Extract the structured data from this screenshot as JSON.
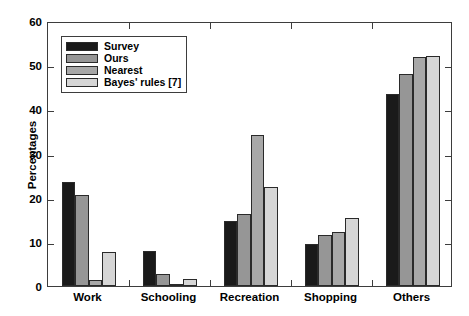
{
  "chart_data": {
    "type": "bar",
    "title": "",
    "xlabel": "",
    "ylabel": "Percentages",
    "ylim": [
      0,
      60
    ],
    "yticks": [
      0,
      10,
      20,
      30,
      40,
      50,
      60
    ],
    "grid": false,
    "legend_position": "upper-left-inside",
    "categories": [
      "Work",
      "Schooling",
      "Recreation",
      "Shopping",
      "Others"
    ],
    "series": [
      {
        "name": "Survey",
        "color": "#1a1a1a",
        "values": [
          23.5,
          8.0,
          14.8,
          9.5,
          43.5
        ]
      },
      {
        "name": "Ours",
        "color": "#969696",
        "values": [
          20.6,
          2.8,
          16.2,
          11.5,
          48.0
        ]
      },
      {
        "name": "Nearest",
        "color": "#a8a8a8",
        "values": [
          1.3,
          0.5,
          34.3,
          12.2,
          51.8
        ]
      },
      {
        "name": "Bayes' rules [7]",
        "color": "#d6d6d6",
        "values": [
          7.7,
          1.6,
          22.5,
          15.5,
          52.1
        ]
      }
    ]
  },
  "axis": {
    "y_label": "Percentages",
    "y_tick_labels": [
      "0",
      "10",
      "20",
      "30",
      "40",
      "50",
      "60"
    ],
    "x_tick_labels": [
      "Work",
      "Schooling",
      "Recreation",
      "Shopping",
      "Others"
    ]
  },
  "legend": {
    "entries": [
      {
        "label": "Survey",
        "color": "#1a1a1a"
      },
      {
        "label": "Ours",
        "color": "#969696"
      },
      {
        "label": "Nearest",
        "color": "#a8a8a8"
      },
      {
        "label": "Bayes' rules [7]",
        "color": "#d6d6d6"
      }
    ]
  },
  "style": {
    "axis_color": "#3d3d3d",
    "bar_edge_color": "#2a2a2a",
    "background": "#ffffff"
  }
}
